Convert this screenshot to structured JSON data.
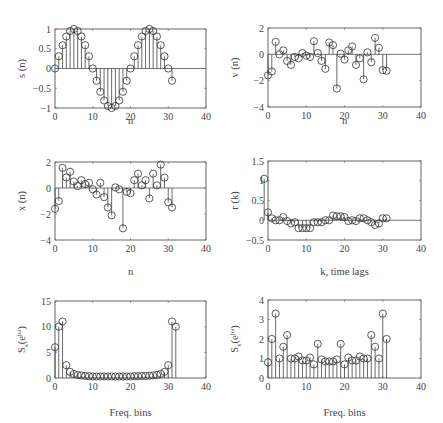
{
  "chart_data": [
    {
      "id": "s",
      "type": "stem",
      "ylabel": "s (n)",
      "xlabel": "n",
      "xlim": [
        0,
        40
      ],
      "ylim": [
        -1,
        1
      ],
      "xticks": [
        0,
        10,
        20,
        30,
        40
      ],
      "yticks": [
        -1,
        -0.5,
        0,
        0.5,
        1
      ],
      "ytick_labels": [
        "−1",
        "−0.5",
        "0",
        "0.5",
        "1"
      ],
      "x": [
        0,
        1,
        2,
        3,
        4,
        5,
        6,
        7,
        8,
        9,
        10,
        11,
        12,
        13,
        14,
        15,
        16,
        17,
        18,
        19,
        20,
        21,
        22,
        23,
        24,
        25,
        26,
        27,
        28,
        29,
        30,
        31
      ],
      "values": [
        0,
        0.31,
        0.59,
        0.81,
        0.95,
        1,
        0.95,
        0.81,
        0.59,
        0.31,
        0,
        -0.31,
        -0.59,
        -0.81,
        -0.95,
        -1,
        -0.95,
        -0.81,
        -0.59,
        -0.31,
        0,
        0.31,
        0.59,
        0.81,
        0.95,
        1,
        0.95,
        0.81,
        0.59,
        0.31,
        0,
        -0.31
      ]
    },
    {
      "id": "v",
      "type": "stem",
      "ylabel": "v (n)",
      "xlabel": "n",
      "xlim": [
        0,
        40
      ],
      "ylim": [
        -4,
        2
      ],
      "xticks": [
        0,
        10,
        20,
        30,
        40
      ],
      "yticks": [
        -4,
        -2,
        0,
        2
      ],
      "ytick_labels": [
        "−4",
        "−2",
        "0",
        "2"
      ],
      "x": [
        0,
        1,
        2,
        3,
        4,
        5,
        6,
        7,
        8,
        9,
        10,
        11,
        12,
        13,
        14,
        15,
        16,
        17,
        18,
        19,
        20,
        21,
        22,
        23,
        24,
        25,
        26,
        27,
        28,
        29,
        30,
        31
      ],
      "values": [
        -1.6,
        -1.3,
        0.95,
        0.0,
        0.3,
        -0.5,
        -0.8,
        -0.2,
        -0.3,
        0.1,
        -0.1,
        -0.2,
        1.0,
        0.1,
        -0.5,
        -1.1,
        0.9,
        0.7,
        -2.6,
        0.05,
        -0.4,
        0.3,
        0.6,
        -0.8,
        -0.3,
        -1.9,
        0.15,
        -0.6,
        1.25,
        0.5,
        -1.2,
        -1.25
      ]
    },
    {
      "id": "x",
      "type": "stem",
      "ylabel": "x (n)",
      "xlabel": "n",
      "xlim": [
        0,
        40
      ],
      "ylim": [
        -4,
        2
      ],
      "xticks": [
        0,
        10,
        20,
        30,
        40
      ],
      "yticks": [
        -4,
        -2,
        0,
        2
      ],
      "ytick_labels": [
        "−4",
        "−2",
        "0",
        "2"
      ],
      "x": [
        0,
        1,
        2,
        3,
        4,
        5,
        6,
        7,
        8,
        9,
        10,
        11,
        12,
        13,
        14,
        15,
        16,
        17,
        18,
        19,
        20,
        21,
        22,
        23,
        24,
        25,
        26,
        27,
        28,
        29,
        30,
        31
      ],
      "values": [
        -1.6,
        -1.0,
        1.55,
        0.81,
        1.25,
        0.5,
        0.15,
        0.6,
        0.3,
        0.4,
        -0.1,
        -0.5,
        0.4,
        -0.7,
        -1.5,
        -2.1,
        0.05,
        -0.1,
        -3.1,
        -0.3,
        -0.4,
        0.6,
        1.1,
        0.2,
        0.6,
        -0.8,
        1.1,
        0.2,
        1.8,
        0.8,
        -1.1,
        -1.5
      ]
    },
    {
      "id": "r",
      "type": "stem",
      "ylabel": "r (k)",
      "xlabel": "k, time lags",
      "xlim": [
        0,
        40
      ],
      "ylim": [
        -0.5,
        1.5
      ],
      "xticks": [
        0,
        10,
        20,
        30,
        40
      ],
      "yticks": [
        -0.5,
        0,
        0.5,
        1,
        1.5
      ],
      "ytick_labels": [
        "−0.5",
        "0",
        "0.5",
        "1",
        "1.5"
      ],
      "x": [
        -1,
        0,
        1,
        2,
        3,
        4,
        5,
        6,
        7,
        8,
        9,
        10,
        11,
        12,
        13,
        14,
        15,
        16,
        17,
        18,
        19,
        20,
        21,
        22,
        23,
        24,
        25,
        26,
        27,
        28,
        29,
        30,
        31
      ],
      "values": [
        1.05,
        0.2,
        0.05,
        0.0,
        0.0,
        0.08,
        -0.02,
        -0.08,
        -0.05,
        -0.2,
        -0.2,
        -0.2,
        -0.2,
        -0.05,
        -0.05,
        -0.05,
        0.0,
        0.0,
        0.12,
        0.1,
        0.1,
        0.08,
        -0.02,
        0.0,
        -0.02,
        0.05,
        0.05,
        0.0,
        -0.05,
        -0.12,
        -0.08,
        0.05,
        0.05
      ]
    },
    {
      "id": "Ss",
      "type": "stem",
      "ylabel": "S_s(e^{jω})",
      "ylabel_main": "S",
      "ylabel_sub": "s",
      "ylabel_paren": "(e",
      "ylabel_sup": "jω",
      "ylabel_close": ")",
      "xlabel": "Freq. bins",
      "xlim": [
        0,
        40
      ],
      "ylim": [
        0,
        15
      ],
      "xticks": [
        0,
        10,
        20,
        30,
        40
      ],
      "yticks": [
        0,
        5,
        10,
        15
      ],
      "ytick_labels": [
        "0",
        "5",
        "10",
        "15"
      ],
      "x": [
        0,
        1,
        2,
        3,
        4,
        5,
        6,
        7,
        8,
        9,
        10,
        11,
        12,
        13,
        14,
        15,
        16,
        17,
        18,
        19,
        20,
        21,
        22,
        23,
        24,
        25,
        26,
        27,
        28,
        29,
        30,
        31,
        32
      ],
      "values": [
        6,
        10,
        11,
        2.5,
        1.2,
        0.8,
        0.6,
        0.5,
        0.4,
        0.35,
        0.3,
        0.3,
        0.3,
        0.3,
        0.3,
        0.3,
        0.3,
        0.3,
        0.3,
        0.3,
        0.3,
        0.35,
        0.35,
        0.4,
        0.4,
        0.45,
        0.5,
        0.6,
        0.8,
        1.2,
        2.5,
        11,
        10
      ]
    },
    {
      "id": "Sx",
      "type": "stem",
      "ylabel": "S_x(e^{jω})",
      "ylabel_main": "S",
      "ylabel_sub": "x",
      "ylabel_paren": "(e",
      "ylabel_sup": "jω",
      "ylabel_close": ")",
      "xlabel": "Freq. bins",
      "xlim": [
        0,
        40
      ],
      "ylim": [
        0,
        4
      ],
      "xticks": [
        0,
        10,
        20,
        30,
        40
      ],
      "yticks": [
        0,
        1,
        2,
        3,
        4
      ],
      "ytick_labels": [
        "0",
        "1",
        "2",
        "3",
        "4"
      ],
      "x": [
        0,
        1,
        2,
        3,
        4,
        5,
        6,
        7,
        8,
        9,
        10,
        11,
        12,
        13,
        14,
        15,
        16,
        17,
        18,
        19,
        20,
        21,
        22,
        23,
        24,
        25,
        26,
        27,
        28,
        29,
        30,
        31
      ],
      "values": [
        0.8,
        2.0,
        3.3,
        1.0,
        1.6,
        2.2,
        1.0,
        1.0,
        1.1,
        0.9,
        0.9,
        1.05,
        0.7,
        1.75,
        0.95,
        0.85,
        0.85,
        0.85,
        0.95,
        1.75,
        0.7,
        1.05,
        0.9,
        0.9,
        1.1,
        1.0,
        1.0,
        2.2,
        1.6,
        1.0,
        3.3,
        2.0
      ]
    }
  ]
}
